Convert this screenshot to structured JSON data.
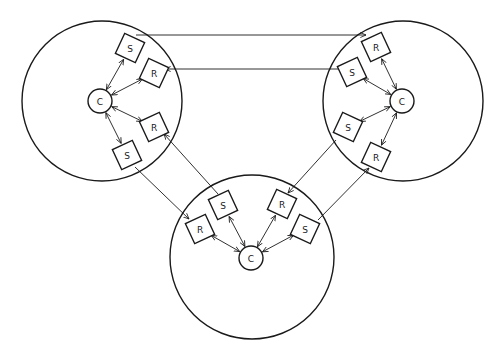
{
  "diagram": {
    "colors": {
      "stroke": "#1a1a1a",
      "background": "#ffffff"
    },
    "clusters": [
      {
        "id": "left",
        "ring": {
          "cx": 102,
          "cy": 101,
          "r": 80
        },
        "hub": {
          "label": "C",
          "cx": 100,
          "cy": 101,
          "r": 12
        },
        "nodes": [
          {
            "id": "L-S1",
            "label": "S",
            "cx": 130,
            "cy": 48,
            "rot": 25
          },
          {
            "id": "L-R1",
            "label": "R",
            "cx": 154,
            "cy": 73,
            "rot": 25
          },
          {
            "id": "L-R2",
            "label": "R",
            "cx": 154,
            "cy": 127,
            "rot": -25
          },
          {
            "id": "L-S2",
            "label": "S",
            "cx": 127,
            "cy": 155,
            "rot": -25
          }
        ]
      },
      {
        "id": "right",
        "ring": {
          "cx": 403,
          "cy": 101,
          "r": 80
        },
        "hub": {
          "label": "C",
          "cx": 402,
          "cy": 101,
          "r": 12
        },
        "nodes": [
          {
            "id": "R-R1",
            "label": "R",
            "cx": 376,
            "cy": 47,
            "rot": -25
          },
          {
            "id": "R-S1",
            "label": "S",
            "cx": 352,
            "cy": 72,
            "rot": -25
          },
          {
            "id": "R-S2",
            "label": "S",
            "cx": 348,
            "cy": 127,
            "rot": 25
          },
          {
            "id": "R-R2",
            "label": "R",
            "cx": 376,
            "cy": 157,
            "rot": 25
          }
        ]
      },
      {
        "id": "bottom",
        "ring": {
          "cx": 252,
          "cy": 257,
          "r": 82
        },
        "hub": {
          "label": "C",
          "cx": 251,
          "cy": 258,
          "r": 12
        },
        "nodes": [
          {
            "id": "B-R1",
            "label": "R",
            "cx": 200,
            "cy": 229,
            "rot": -25
          },
          {
            "id": "B-S1",
            "label": "S",
            "cx": 223,
            "cy": 205,
            "rot": -25
          },
          {
            "id": "B-R2",
            "label": "R",
            "cx": 282,
            "cy": 204,
            "rot": 25
          },
          {
            "id": "B-S2",
            "label": "S",
            "cx": 305,
            "cy": 229,
            "rot": 25
          }
        ]
      }
    ],
    "inter_links": [
      {
        "from": "L-S1",
        "to": "R-R1",
        "points": [
          [
            136,
            35
          ],
          [
            366,
            35
          ]
        ]
      },
      {
        "from": "R-S1",
        "to": "L-R1",
        "points": [
          [
            340,
            69
          ],
          [
            165,
            69
          ]
        ]
      },
      {
        "from": "L-S2",
        "to": "B-R1",
        "points": [
          [
            135,
            167
          ],
          [
            189,
            219
          ]
        ]
      },
      {
        "from": "B-S1",
        "to": "L-R2",
        "points": [
          [
            218,
            194
          ],
          [
            164,
            134
          ]
        ]
      },
      {
        "from": "R-S2",
        "to": "B-R2",
        "points": [
          [
            336,
            140
          ],
          [
            288,
            193
          ]
        ]
      },
      {
        "from": "B-S2",
        "to": "R-R2",
        "points": [
          [
            318,
            220
          ],
          [
            369,
            168
          ]
        ]
      }
    ]
  }
}
